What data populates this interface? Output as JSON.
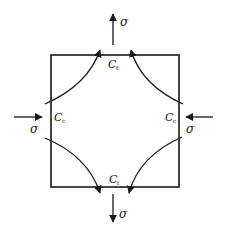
{
  "diagram": {
    "type": "stress-element",
    "labels": {
      "sigma_top": "σ",
      "sigma_bottom": "σ",
      "sigma_left": "σ",
      "sigma_right": "σ",
      "c_top": {
        "main": "C",
        "sub": "t"
      },
      "c_bottom": {
        "main": "C",
        "sub": "t"
      },
      "c_left": {
        "main": "C",
        "sub": "c"
      },
      "c_right": {
        "main": "C",
        "sub": "c"
      }
    },
    "colors": {
      "stroke": "#1a1a1a",
      "background": "#ffffff"
    }
  }
}
